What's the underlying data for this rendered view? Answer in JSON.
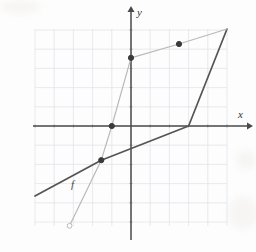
{
  "figure": {
    "title": "",
    "x_axis_label": "x",
    "y_axis_label": "y",
    "function_label": "f",
    "background_color": "#fdfdfd",
    "grid_color": "#dfe4ea",
    "axis_color": "#4a4a4a",
    "curve_f_color": "#545454",
    "curve_g_color": "#b9b9b9",
    "point_color": "#3a3a3a"
  },
  "chart_data": {
    "type": "line",
    "title": "",
    "xlabel": "x",
    "ylabel": "y",
    "grid": true,
    "legend": "none",
    "xlim": [
      -5,
      5
    ],
    "ylim": [
      -5.2,
      5.05
    ],
    "xticks": [
      -5,
      -4,
      -3,
      -2,
      -1,
      0,
      1,
      2,
      3,
      4,
      5
    ],
    "yticks": [
      -5,
      -4,
      -3,
      -2,
      -1,
      0,
      1,
      2,
      3,
      4,
      5
    ],
    "grid_spacing": 1,
    "series": [
      {
        "name": "f",
        "style": "solid-dark piecewise-linear",
        "color": "#545454",
        "x": [
          -5,
          -1.55,
          3,
          5
        ],
        "y": [
          -3.65,
          -1.78,
          0,
          5.05
        ]
      },
      {
        "name": "g",
        "style": "solid-light curve",
        "color": "#b9b9b9",
        "x": [
          -3.2,
          -1.55,
          -1.0,
          0,
          2.5,
          5
        ],
        "y": [
          -5.2,
          -1.78,
          0,
          3.55,
          4.27,
          5.05
        ]
      }
    ],
    "points": [
      {
        "label": "",
        "x": 0,
        "y": 3.55,
        "filled": true
      },
      {
        "label": "",
        "x": 2.5,
        "y": 4.27,
        "filled": true
      },
      {
        "label": "",
        "x": -1.0,
        "y": 0,
        "filled": true
      },
      {
        "label": "",
        "x": -1.55,
        "y": -1.78,
        "filled": true
      },
      {
        "label": "",
        "x": -3.2,
        "y": -5.2,
        "filled": false
      }
    ],
    "annotations": [
      {
        "text": "f",
        "x": -2.9,
        "y": -2.95
      }
    ]
  }
}
